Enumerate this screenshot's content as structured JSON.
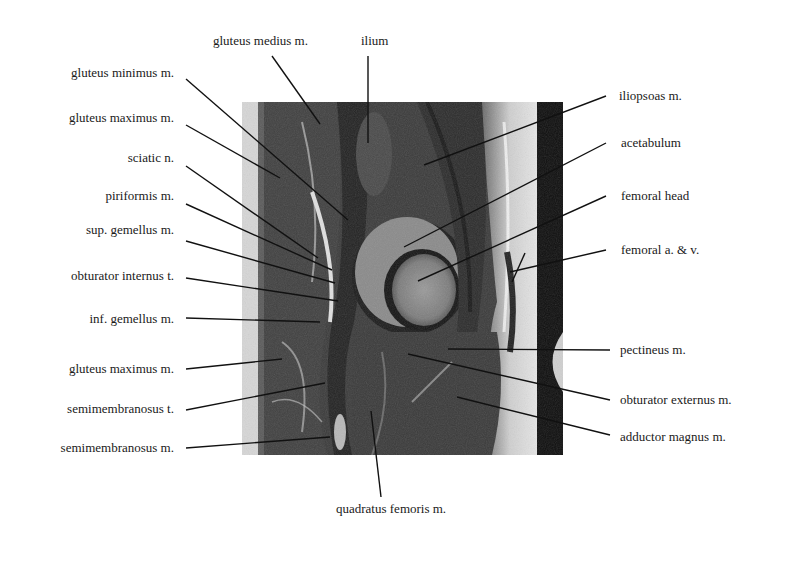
{
  "figure": {
    "image_description": "sagittal MRI slice of the hip",
    "labels_left": [
      {
        "id": "gluteus-minimus",
        "text": "gluteus minimus m.",
        "x": 174,
        "y": 73
      },
      {
        "id": "gluteus-maximus-upper",
        "text": "gluteus maximus m.",
        "x": 174,
        "y": 118
      },
      {
        "id": "sciatic-nerve",
        "text": "sciatic n.",
        "x": 174,
        "y": 158
      },
      {
        "id": "piriformis",
        "text": "piriformis m.",
        "x": 174,
        "y": 196
      },
      {
        "id": "sup-gemellus",
        "text": "sup. gemellus m.",
        "x": 174,
        "y": 229
      },
      {
        "id": "obturator-internus",
        "text": "obturator internus t.",
        "x": 174,
        "y": 275
      },
      {
        "id": "inf-gemellus",
        "text": "inf. gemellus m.",
        "x": 174,
        "y": 318
      },
      {
        "id": "gluteus-maximus-lower",
        "text": "gluteus maximus m.",
        "x": 174,
        "y": 368
      },
      {
        "id": "semimembranosus-t",
        "text": "semimembranosus t.",
        "x": 174,
        "y": 409
      },
      {
        "id": "semimembranosus-m",
        "text": "semimembranosus m.",
        "x": 174,
        "y": 448
      }
    ],
    "labels_top": [
      {
        "id": "gluteus-medius",
        "text": "gluteus medius m.",
        "x": 270,
        "y": 41
      },
      {
        "id": "ilium",
        "text": "ilium",
        "x": 378,
        "y": 41
      }
    ],
    "labels_right": [
      {
        "id": "iliopsoas",
        "text": "iliopsoas m.",
        "x": 609,
        "y": 96
      },
      {
        "id": "acetabulum",
        "text": "acetabulum",
        "x": 610,
        "y": 143
      },
      {
        "id": "femoral-head",
        "text": "femoral head",
        "x": 610,
        "y": 196
      },
      {
        "id": "femoral-vessels",
        "text": "femoral a. & v.",
        "x": 610,
        "y": 250
      },
      {
        "id": "pectineus",
        "text": "pectineus m.",
        "x": 620,
        "y": 350
      },
      {
        "id": "obturator-externus",
        "text": "obturator externus m.",
        "x": 620,
        "y": 400
      },
      {
        "id": "adductor-magnus",
        "text": "adductor magnus m.",
        "x": 620,
        "y": 437
      }
    ],
    "labels_bottom": [
      {
        "id": "quadratus-femoris",
        "text": "quadratus femoris m.",
        "x": 401,
        "y": 509
      }
    ]
  },
  "colors": {
    "background": "#ffffff",
    "text": "#1a1a1a",
    "leader_line": "#111111",
    "mri_dark": "#161616",
    "mri_muscle": "#3a3a3a",
    "mri_fat": "#d8d8d8",
    "mri_bone": "#8a8a8a"
  }
}
